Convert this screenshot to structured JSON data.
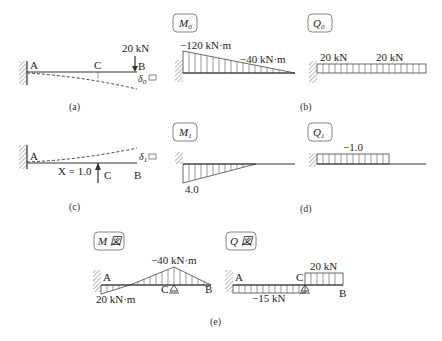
{
  "panels": {
    "a": {
      "caption": "(a)",
      "node_A": "A",
      "node_B": "B",
      "node_C": "C",
      "load": "20 kN",
      "deflection_symbol": "δ",
      "deflection_sub": "0"
    },
    "b": {
      "caption": "(b)",
      "moment_title": "M",
      "moment_sub": "0",
      "moment_label_A": "−120 kN·m",
      "moment_label_C": "−40 kN·m",
      "shear_title": "Q",
      "shear_sub": "0",
      "shear_label_1": "20 kN",
      "shear_label_2": "20 kN"
    },
    "c": {
      "caption": "(c)",
      "node_A": "A",
      "node_B": "B",
      "node_C": "C",
      "unit_load": "X = 1.0",
      "deflection_symbol": "δ",
      "deflection_sub": "1"
    },
    "d": {
      "caption": "(d)",
      "moment_title": "M",
      "moment_sub": "1",
      "moment_label_A": "4.0",
      "shear_title": "Q",
      "shear_sub": "1",
      "shear_label": "−1.0"
    },
    "e": {
      "caption": "(e)",
      "moment_title": "M 図",
      "moment_label_A": "20 kN·m",
      "moment_label_C": "−40 kN·m",
      "node_A": "A",
      "node_B": "B",
      "node_C": "C",
      "shear_title": "Q 図",
      "shear_label_AC": "−15 kN",
      "shear_label_CB": "20 kN"
    }
  }
}
